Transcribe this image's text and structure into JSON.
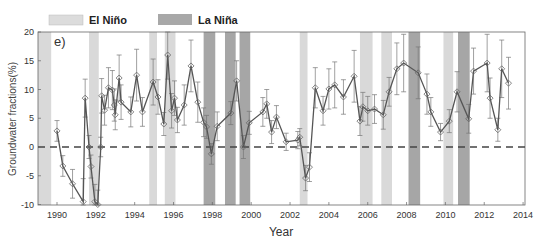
{
  "chart_data": {
    "type": "line",
    "panel_label": "e)",
    "title": "",
    "xlabel": "Year",
    "ylabel": "Groundwater fractions(%)",
    "xlim": [
      1989.0,
      2014.0
    ],
    "ylim": [
      -10,
      20
    ],
    "xticks": [
      1990,
      1992,
      1994,
      1996,
      1998,
      2000,
      2002,
      2004,
      2006,
      2008,
      2010,
      2012,
      2014
    ],
    "yticks": [
      -10,
      -5,
      0,
      5,
      10,
      15,
      20
    ],
    "reference_line": {
      "y": 0,
      "style": "dashed"
    },
    "legend": [
      {
        "label": "El Niño",
        "color": "#d9d9d9"
      },
      {
        "label": "La Niña",
        "color": "#a6a6a6"
      }
    ],
    "shaded_periods": [
      {
        "type": "El Niño",
        "start": 1989.0,
        "end": 1989.7
      },
      {
        "type": "El Niño",
        "start": 1991.65,
        "end": 1992.15
      },
      {
        "type": "El Niño",
        "start": 1994.75,
        "end": 1995.15
      },
      {
        "type": "El Niño",
        "start": 1995.55,
        "end": 1996.1
      },
      {
        "type": "La Niña",
        "start": 1997.55,
        "end": 1998.15
      },
      {
        "type": "La Niña",
        "start": 1998.65,
        "end": 1999.2
      },
      {
        "type": "La Niña",
        "start": 1999.4,
        "end": 1999.95
      },
      {
        "type": "El Niño",
        "start": 2002.5,
        "end": 2002.9
      },
      {
        "type": "El Niño",
        "start": 2005.6,
        "end": 2006.25
      },
      {
        "type": "El Niño",
        "start": 2006.7,
        "end": 2007.25
      },
      {
        "type": "La Niña",
        "start": 2008.1,
        "end": 2008.7
      },
      {
        "type": "El Niño",
        "start": 2009.9,
        "end": 2010.4
      },
      {
        "type": "La Niña",
        "start": 2010.65,
        "end": 2011.25
      }
    ],
    "series": [
      {
        "name": "Groundwater fractions",
        "marker": "diamond",
        "x": [
          1990.0,
          1990.3,
          1990.8,
          1991.35,
          1991.45,
          1991.65,
          1991.75,
          1991.95,
          1992.1,
          1992.25,
          1992.3,
          1992.45,
          1992.65,
          1992.85,
          1992.95,
          1993.0,
          1993.2,
          1993.3,
          1993.8,
          1994.1,
          1994.4,
          1994.95,
          1995.2,
          1995.5,
          1995.7,
          1995.9,
          1996.05,
          1996.2,
          1996.55,
          1996.9,
          1997.25,
          1997.55,
          1997.7,
          1997.95,
          1998.25,
          1998.95,
          1999.25,
          1999.6,
          1999.9,
          2000.6,
          2000.8,
          2001.05,
          2001.3,
          2001.8,
          2002.4,
          2002.5,
          2002.8,
          2003.0,
          2003.3,
          2003.7,
          2004.0,
          2004.3,
          2004.75,
          2005.3,
          2005.6,
          2005.75,
          2006.0,
          2006.35,
          2006.8,
          2007.1,
          2007.5,
          2007.85,
          2008.6,
          2009.05,
          2009.25,
          2009.75,
          2010.2,
          2010.6,
          2011.2,
          2011.45,
          2012.15,
          2012.3,
          2012.7,
          2012.9,
          2013.25
        ],
        "values": [
          2.8,
          -3.3,
          -6.4,
          -9.5,
          8.5,
          0.0,
          -3.4,
          -9.5,
          -10.0,
          0.0,
          8.9,
          6.4,
          10.3,
          9.9,
          7.3,
          5.6,
          12.0,
          7.8,
          6.1,
          12.5,
          6.1,
          11.3,
          8.7,
          4.0,
          16.0,
          6.3,
          8.5,
          4.7,
          7.3,
          14.1,
          7.8,
          4.3,
          3.5,
          -1.2,
          3.6,
          5.9,
          11.5,
          0.0,
          4.2,
          6.1,
          7.5,
          2.6,
          5.2,
          0.9,
          1.2,
          1.7,
          -5.4,
          -3.5,
          10.3,
          6.3,
          10.1,
          10.8,
          8.7,
          12.3,
          4.5,
          7.0,
          6.3,
          6.6,
          5.6,
          9.6,
          13.6,
          14.6,
          12.9,
          9.2,
          6.1,
          2.6,
          4.5,
          9.6,
          4.9,
          13.2,
          14.6,
          8.5,
          3.0,
          13.6,
          11.1
        ],
        "error": [
          1.8,
          1.8,
          2.5,
          4.0,
          3.3,
          2.0,
          2.0,
          3.0,
          2.5,
          1.7,
          3.0,
          2.6,
          3.5,
          3.4,
          2.8,
          2.6,
          4.0,
          3.0,
          2.6,
          4.5,
          2.5,
          4.0,
          3.0,
          2.0,
          4.2,
          3.0,
          3.0,
          2.2,
          3.5,
          4.5,
          3.5,
          2.5,
          2.0,
          1.8,
          2.5,
          2.0,
          3.5,
          2.0,
          2.0,
          2.5,
          2.5,
          2.0,
          2.0,
          1.5,
          1.5,
          1.5,
          2.2,
          2.5,
          3.5,
          2.5,
          3.5,
          4.0,
          3.0,
          4.5,
          2.5,
          2.5,
          2.5,
          2.5,
          2.5,
          2.5,
          4.5,
          5.0,
          4.5,
          3.5,
          2.5,
          1.5,
          2.0,
          3.5,
          2.5,
          4.0,
          5.0,
          3.5,
          2.0,
          5.0,
          4.5
        ]
      }
    ]
  },
  "legend": {
    "el_nino_label": "El Niño",
    "la_nina_label": "La Niña"
  },
  "axes": {
    "xlabel": "Year",
    "ylabel": "Groundwater fractions(%)",
    "panel_label": "e)"
  }
}
